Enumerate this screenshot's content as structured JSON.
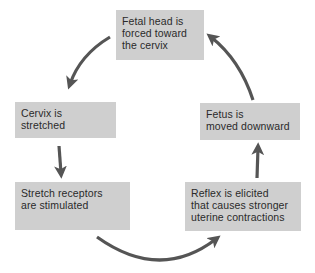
{
  "diagram": {
    "type": "cycle",
    "title": "",
    "colors": {
      "box_fill": "#cfcfcf",
      "arrow": "#555555",
      "text": "#2a2a2a"
    },
    "nodes": [
      {
        "id": "fetal-head",
        "lines": [
          "Fetal head is",
          "forced toward",
          "the cervix"
        ]
      },
      {
        "id": "cervix",
        "lines": [
          "Cervix is",
          "stretched"
        ]
      },
      {
        "id": "stretch-receptors",
        "lines": [
          "Stretch receptors",
          "are stimulated"
        ]
      },
      {
        "id": "reflex",
        "lines": [
          "Reflex is elicited",
          "that causes stronger",
          "uterine contractions"
        ]
      },
      {
        "id": "fetus",
        "lines": [
          "Fetus is",
          "moved downward"
        ]
      }
    ],
    "edges": [
      {
        "from": "fetal-head",
        "to": "cervix"
      },
      {
        "from": "cervix",
        "to": "stretch-receptors"
      },
      {
        "from": "stretch-receptors",
        "to": "reflex"
      },
      {
        "from": "reflex",
        "to": "fetus"
      },
      {
        "from": "fetus",
        "to": "fetal-head"
      }
    ]
  }
}
